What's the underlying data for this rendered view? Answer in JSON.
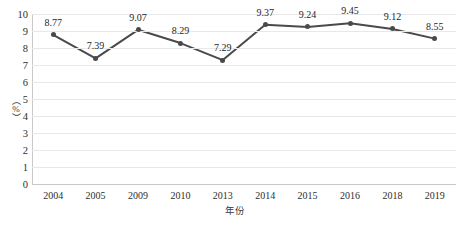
{
  "chart_data": {
    "type": "line",
    "title": "",
    "subtitle": "",
    "xlabel": "年份",
    "ylabel": "（%）",
    "categories": [
      "2004",
      "2005",
      "2009",
      "2010",
      "2013",
      "2014",
      "2015",
      "2016",
      "2018",
      "2019"
    ],
    "values": [
      8.77,
      7.39,
      9.07,
      8.29,
      7.29,
      9.37,
      9.24,
      9.45,
      9.12,
      8.55
    ],
    "point_labels": [
      "8.77",
      "7.39",
      "9.07",
      "8.29",
      "7.29",
      "9.37",
      "9.24",
      "9.45",
      "9.12",
      "8.55"
    ],
    "ylim": [
      0,
      10
    ],
    "yticks": [
      0,
      1,
      2,
      3,
      4,
      5,
      6,
      7,
      8,
      9,
      10
    ],
    "ytick_labels": [
      "0",
      "1",
      "2",
      "3",
      "4",
      "5",
      "6",
      "7",
      "8",
      "9",
      "10"
    ],
    "grid": true,
    "grid_axis": "y",
    "legend": false,
    "legend_position": "none",
    "series": [
      {
        "name": "",
        "values": [
          8.77,
          7.39,
          9.07,
          8.29,
          7.29,
          9.37,
          9.24,
          9.45,
          9.12,
          8.55
        ],
        "color": "#4a4a4a",
        "marker": "circle",
        "line_width": 2,
        "data_labels": true
      }
    ],
    "colors": {
      "line": "#4a4a4a",
      "marker": "#4a4a4a",
      "grid": "#e8e8e8",
      "axis": "#c9c9c9",
      "text": "#2e2e2e",
      "background": "#ffffff"
    }
  }
}
